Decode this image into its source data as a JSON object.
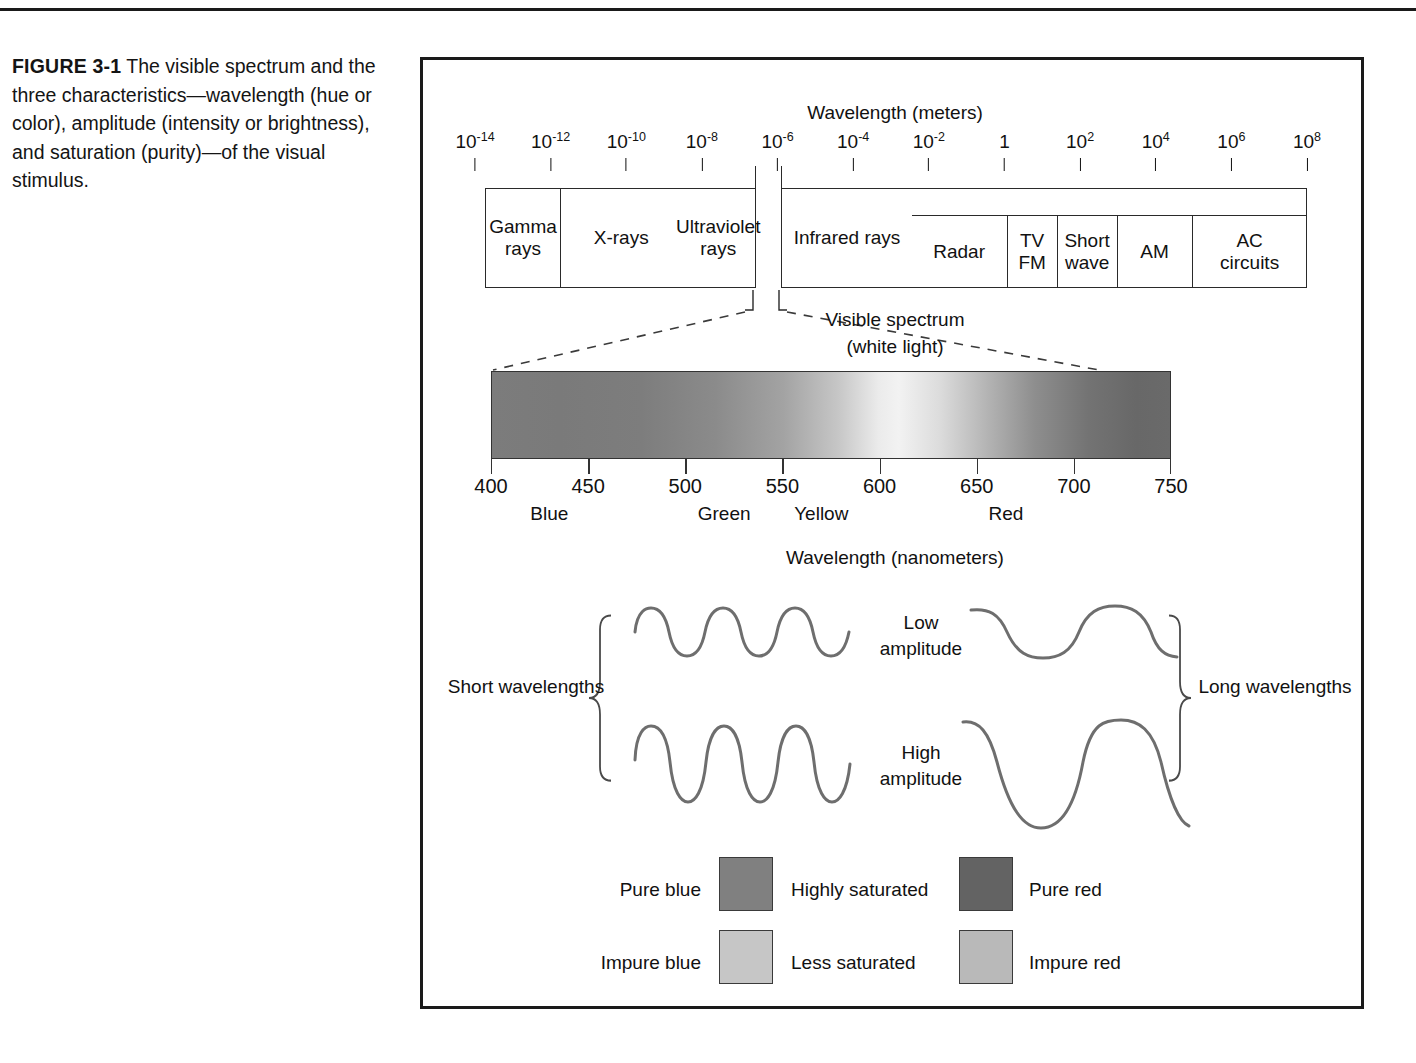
{
  "caption": {
    "figure_number": "FIGURE 3-1",
    "text": " The visible spectrum and the three characteristics—wavelength (hue or color), amplitude (intensity or brightness), and saturation (purity)—of the visual stimulus."
  },
  "figure": {
    "em_scale_title": "Wavelength  (meters)",
    "em_ticks": [
      {
        "mantissa": "10",
        "exponent": "-14"
      },
      {
        "mantissa": "10",
        "exponent": "-12"
      },
      {
        "mantissa": "10",
        "exponent": "-10"
      },
      {
        "mantissa": "10",
        "exponent": "-8"
      },
      {
        "mantissa": "10",
        "exponent": "-6"
      },
      {
        "mantissa": "10",
        "exponent": "-4"
      },
      {
        "mantissa": "10",
        "exponent": "-2"
      },
      {
        "mantissa": "1",
        "exponent": ""
      },
      {
        "mantissa": "10",
        "exponent": "2"
      },
      {
        "mantissa": "10",
        "exponent": "4"
      },
      {
        "mantissa": "10",
        "exponent": "6"
      },
      {
        "mantissa": "10",
        "exponent": "8"
      }
    ],
    "bands_left": [
      {
        "label": "Gamma rays"
      },
      {
        "label": "X-rays"
      },
      {
        "label": "Ultraviolet rays"
      }
    ],
    "bands_right": [
      {
        "label": "Infrared rays"
      }
    ],
    "radio_subbands": [
      {
        "label": "Radar"
      },
      {
        "label": "TV FM"
      },
      {
        "label": "Short wave"
      },
      {
        "label": "AM"
      },
      {
        "label": "AC circuits"
      }
    ],
    "callout_line1": "Visible spectrum",
    "callout_line2": "(white light)",
    "nm_ticks": [
      "400",
      "450",
      "500",
      "550",
      "600",
      "650",
      "700",
      "750"
    ],
    "hue_labels": [
      {
        "name": "Blue",
        "nm": 430
      },
      {
        "name": "Green",
        "nm": 520
      },
      {
        "name": "Yellow",
        "nm": 570
      },
      {
        "name": "Red",
        "nm": 665
      }
    ],
    "nm_scale_title": "Wavelength (nanometers)",
    "wave_labels": {
      "short": "Short wavelengths",
      "long": "Long wavelengths",
      "low_amplitude": "Low amplitude",
      "high_amplitude": "High amplitude"
    },
    "saturation": {
      "row1": {
        "left_label": "Pure blue",
        "center_label": "Highly saturated",
        "right_label": "Pure red",
        "left_color": "#808080",
        "right_color": "#636363"
      },
      "row2": {
        "left_label": "Impure blue",
        "center_label": "Less saturated",
        "right_label": "Impure red",
        "left_color": "#c6c6c6",
        "right_color": "#b9b9b9"
      }
    },
    "colors": {
      "ink": "#1a1a1a",
      "wave_stroke": "#6e6e6e",
      "brace_stroke": "#4a4a4a",
      "frame": "#1a1a1a"
    }
  },
  "chart_data": {
    "type": "diagram",
    "em_axis": {
      "label": "Wavelength (meters)",
      "tick_values": [
        1e-14,
        1e-12,
        1e-10,
        1e-08,
        1e-06,
        0.0001,
        0.01,
        1,
        100,
        10000,
        1000000,
        100000000
      ],
      "tick_labels": [
        "10^-14",
        "10^-12",
        "10^-10",
        "10^-8",
        "10^-6",
        "10^-4",
        "10^-2",
        "1",
        "10^2",
        "10^4",
        "10^6",
        "10^8"
      ],
      "scale": "log"
    },
    "em_bands": [
      {
        "name": "Gamma rays",
        "start_exp": -14,
        "end_exp": -12
      },
      {
        "name": "X-rays",
        "start_exp": -12,
        "end_exp": -9
      },
      {
        "name": "Ultraviolet rays",
        "start_exp": -9,
        "end_exp": -6.5
      },
      {
        "name": "Visible spectrum",
        "start_exp": -6.5,
        "end_exp": -6.1
      },
      {
        "name": "Infrared rays",
        "start_exp": -6.1,
        "end_exp": -3.2
      },
      {
        "name": "Radar",
        "start_exp": -3.2,
        "end_exp": -1
      },
      {
        "name": "TV FM",
        "start_exp": -1,
        "end_exp": 0.3
      },
      {
        "name": "Short wave",
        "start_exp": 0.3,
        "end_exp": 1.6
      },
      {
        "name": "AM",
        "start_exp": 1.6,
        "end_exp": 3.6
      },
      {
        "name": "AC circuits",
        "start_exp": 3.6,
        "end_exp": 8
      }
    ],
    "visible_axis": {
      "label": "Wavelength (nanometers)",
      "min": 400,
      "max": 750,
      "ticks": [
        400,
        450,
        500,
        550,
        600,
        650,
        700,
        750
      ],
      "hues": [
        {
          "name": "Blue",
          "nm": 430
        },
        {
          "name": "Green",
          "nm": 520
        },
        {
          "name": "Yellow",
          "nm": 570
        },
        {
          "name": "Red",
          "nm": 665
        }
      ]
    },
    "waves": [
      {
        "position": "top-left",
        "wavelength": "short",
        "amplitude": "low",
        "cycles": 4
      },
      {
        "position": "top-right",
        "wavelength": "long",
        "amplitude": "low",
        "cycles": 1.5
      },
      {
        "position": "bottom-left",
        "wavelength": "short",
        "amplitude": "high",
        "cycles": 4
      },
      {
        "position": "bottom-right",
        "wavelength": "long",
        "amplitude": "high",
        "cycles": 1.5
      }
    ],
    "saturation_swatches": [
      {
        "label": "Pure blue",
        "level": "Highly saturated",
        "gray": "#808080"
      },
      {
        "label": "Pure red",
        "level": "Highly saturated",
        "gray": "#636363"
      },
      {
        "label": "Impure blue",
        "level": "Less saturated",
        "gray": "#c6c6c6"
      },
      {
        "label": "Impure red",
        "level": "Less saturated",
        "gray": "#b9b9b9"
      }
    ]
  }
}
